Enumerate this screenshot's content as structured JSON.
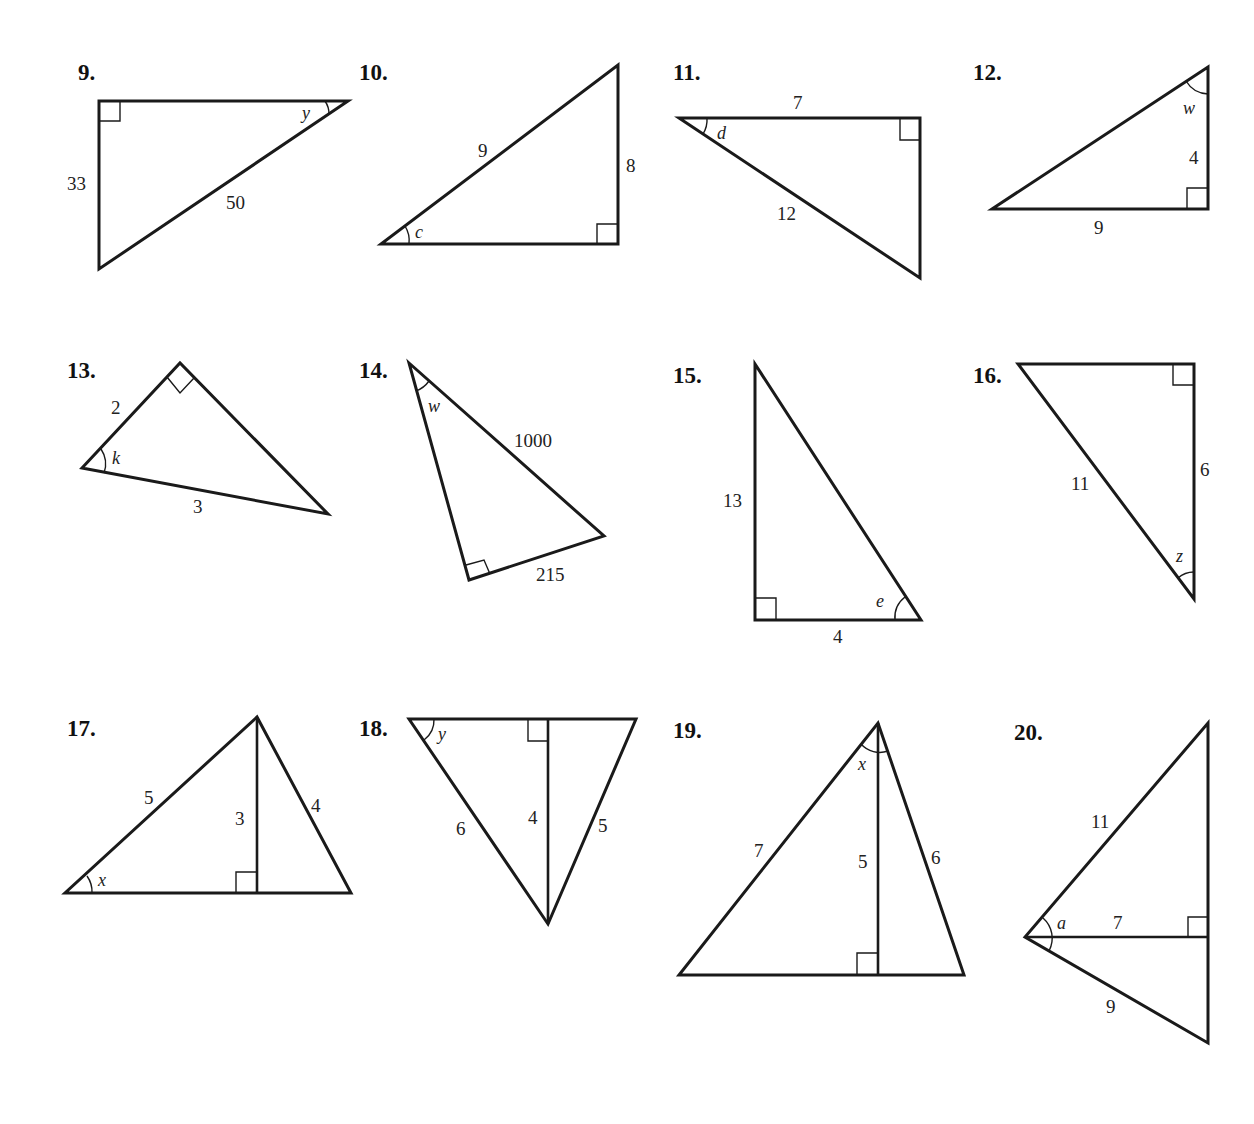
{
  "worksheet": {
    "problems": [
      {
        "number": "9.",
        "angle": "y",
        "sides": {
          "leg_vertical": "33",
          "hypotenuse": "50"
        }
      },
      {
        "number": "10.",
        "angle": "c",
        "sides": {
          "hypotenuse": "9",
          "leg_vertical": "8"
        }
      },
      {
        "number": "11.",
        "angle": "d",
        "sides": {
          "leg_top": "7",
          "hypotenuse": "12"
        }
      },
      {
        "number": "12.",
        "angle": "w",
        "sides": {
          "leg_vertical": "4",
          "leg_bottom": "9"
        }
      },
      {
        "number": "13.",
        "angle": "k",
        "sides": {
          "leg": "2",
          "hypotenuse": "3"
        }
      },
      {
        "number": "14.",
        "angle": "w",
        "sides": {
          "hypotenuse": "1000",
          "leg": "215"
        }
      },
      {
        "number": "15.",
        "angle": "e",
        "sides": {
          "leg_vertical": "13",
          "leg_bottom": "4"
        }
      },
      {
        "number": "16.",
        "angle": "z",
        "sides": {
          "hypotenuse": "11",
          "leg_vertical": "6"
        }
      },
      {
        "number": "17.",
        "angle": "x",
        "sides": {
          "left_hypotenuse": "5",
          "altitude": "3",
          "right_side": "4"
        }
      },
      {
        "number": "18.",
        "angle": "y",
        "sides": {
          "left_side": "6",
          "altitude": "4",
          "right_side": "5"
        }
      },
      {
        "number": "19.",
        "angle": "x",
        "sides": {
          "left_side": "7",
          "altitude": "5",
          "right_side": "6"
        }
      },
      {
        "number": "20.",
        "angle": "a",
        "sides": {
          "upper_side": "11",
          "altitude": "7",
          "lower_side": "9"
        }
      }
    ]
  }
}
